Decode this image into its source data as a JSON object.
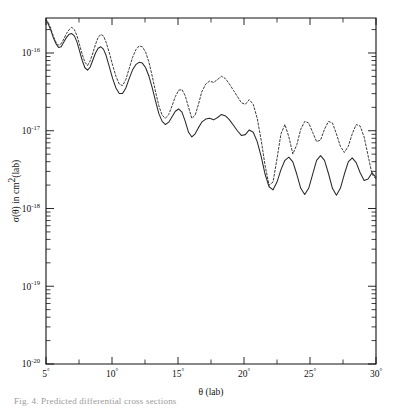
{
  "figure": {
    "name": "differential-cross-section-plot",
    "type": "line-plot",
    "caption_fragment": "Fig. 4. Predicted differential cross sections"
  },
  "axes": {
    "x": {
      "title": "θ (lab)",
      "min": 5,
      "max": 30,
      "unit": "degrees",
      "major_ticks": [
        5,
        10,
        15,
        20,
        25,
        30
      ],
      "major_tick_labels": [
        "5°",
        "10°",
        "15°",
        "20°",
        "25°",
        "30°"
      ],
      "minor_tick_step": 2.5,
      "scale": "linear"
    },
    "y": {
      "title": "σ(θ) in cm²(lab)",
      "title_base": "σ(θ) in cm",
      "title_sup": "2",
      "title_tail": "(lab)",
      "scale": "log",
      "min_exp": -20,
      "max_exp": -15.55,
      "decade_labels": [
        {
          "mantissa": "10",
          "exponent": "-16",
          "value_exp": -16
        },
        {
          "mantissa": "10",
          "exponent": "-17",
          "value_exp": -17
        },
        {
          "mantissa": "10",
          "exponent": "-18",
          "value_exp": -18
        },
        {
          "mantissa": "10",
          "exponent": "-19",
          "value_exp": -19
        },
        {
          "mantissa": "10",
          "exponent": "-20",
          "value_exp": -20
        }
      ]
    }
  },
  "colors": {
    "ink": "#1a1a1a",
    "axis": "#111111",
    "solid_curve": "#2a2a2a",
    "dashed_curve": "#3a3a3a",
    "background": "#ffffff"
  },
  "chart_data": {
    "type": "line",
    "title": "",
    "xlabel": "θ (lab)",
    "ylabel": "σ(θ) in cm²(lab)",
    "xlim": [
      5,
      30
    ],
    "ylim_exp": [
      -20,
      -15.55
    ],
    "yscale": "log",
    "grid": false,
    "legend": "none",
    "series": [
      {
        "name": "solid-curve",
        "style": "solid",
        "x": [
          5.0,
          5.15,
          5.35,
          5.55,
          5.75,
          5.95,
          6.15,
          6.35,
          6.55,
          6.75,
          6.95,
          7.15,
          7.35,
          7.55,
          7.75,
          7.95,
          8.15,
          8.35,
          8.55,
          8.75,
          8.95,
          9.15,
          9.35,
          9.55,
          9.8,
          10.05,
          10.3,
          10.55,
          10.8,
          11.05,
          11.3,
          11.55,
          11.8,
          12.05,
          12.3,
          12.55,
          12.8,
          13.05,
          13.3,
          13.55,
          13.8,
          14.05,
          14.3,
          14.55,
          14.8,
          15.05,
          15.3,
          15.55,
          15.8,
          16.05,
          16.3,
          16.55,
          16.8,
          17.1,
          17.4,
          17.7,
          18.0,
          18.3,
          18.6,
          18.9,
          19.2,
          19.5,
          19.8,
          20.1,
          20.4,
          20.7,
          21.0,
          21.3,
          21.6,
          21.9,
          22.2,
          22.5,
          22.8,
          23.1,
          23.4,
          23.7,
          24.0,
          24.3,
          24.6,
          24.9,
          25.2,
          25.5,
          25.8,
          26.1,
          26.4,
          26.7,
          27.0,
          27.3,
          27.6,
          27.9,
          28.2,
          28.5,
          28.8,
          29.1,
          29.4,
          29.7,
          30.0
        ],
        "y_exp": [
          -15.58,
          -15.62,
          -15.7,
          -15.8,
          -15.88,
          -15.93,
          -15.92,
          -15.86,
          -15.8,
          -15.76,
          -15.75,
          -15.78,
          -15.86,
          -15.98,
          -16.1,
          -16.19,
          -16.22,
          -16.18,
          -16.09,
          -16.0,
          -15.94,
          -15.92,
          -15.95,
          -16.03,
          -16.18,
          -16.33,
          -16.45,
          -16.52,
          -16.52,
          -16.45,
          -16.33,
          -16.22,
          -16.15,
          -16.12,
          -16.13,
          -16.19,
          -16.3,
          -16.45,
          -16.62,
          -16.78,
          -16.88,
          -16.92,
          -16.89,
          -16.82,
          -16.75,
          -16.72,
          -16.76,
          -16.88,
          -17.02,
          -17.08,
          -17.04,
          -16.96,
          -16.89,
          -16.85,
          -16.84,
          -16.86,
          -16.83,
          -16.79,
          -16.81,
          -16.86,
          -16.93,
          -17.0,
          -17.06,
          -17.05,
          -16.99,
          -17.02,
          -17.14,
          -17.33,
          -17.56,
          -17.72,
          -17.76,
          -17.66,
          -17.5,
          -17.38,
          -17.34,
          -17.4,
          -17.56,
          -17.74,
          -17.82,
          -17.74,
          -17.56,
          -17.38,
          -17.32,
          -17.38,
          -17.55,
          -17.74,
          -17.83,
          -17.74,
          -17.56,
          -17.4,
          -17.35,
          -17.41,
          -17.54,
          -17.64,
          -17.62,
          -17.54,
          -17.6
        ]
      },
      {
        "name": "dashed-curve",
        "style": "dashed",
        "x": [
          5.0,
          5.15,
          5.35,
          5.55,
          5.75,
          5.95,
          6.15,
          6.35,
          6.55,
          6.75,
          6.95,
          7.15,
          7.35,
          7.55,
          7.75,
          7.95,
          8.15,
          8.35,
          8.55,
          8.75,
          8.95,
          9.15,
          9.35,
          9.55,
          9.8,
          10.05,
          10.3,
          10.55,
          10.8,
          11.05,
          11.3,
          11.55,
          11.8,
          12.05,
          12.3,
          12.55,
          12.8,
          13.05,
          13.3,
          13.55,
          13.8,
          14.05,
          14.3,
          14.55,
          14.8,
          15.05,
          15.3,
          15.55,
          15.8,
          16.05,
          16.3,
          16.55,
          16.8,
          17.1,
          17.4,
          17.7,
          18.0,
          18.3,
          18.6,
          18.9,
          19.2,
          19.5,
          19.8,
          20.1,
          20.4,
          20.7,
          21.0,
          21.3,
          21.6,
          21.9,
          22.2,
          22.5,
          22.8,
          23.1,
          23.4,
          23.7,
          24.0,
          24.3,
          24.6,
          24.9,
          25.2,
          25.5,
          25.8,
          26.1,
          26.4,
          26.7,
          27.0,
          27.3,
          27.6,
          27.9,
          28.2,
          28.5,
          28.8,
          29.1,
          29.4,
          29.7,
          30.0
        ],
        "y_exp": [
          -15.57,
          -15.6,
          -15.68,
          -15.78,
          -15.86,
          -15.9,
          -15.88,
          -15.82,
          -15.75,
          -15.7,
          -15.67,
          -15.7,
          -15.78,
          -15.9,
          -16.02,
          -16.12,
          -16.16,
          -16.1,
          -16.0,
          -15.89,
          -15.8,
          -15.76,
          -15.78,
          -15.86,
          -16.0,
          -16.16,
          -16.3,
          -16.4,
          -16.42,
          -16.34,
          -16.2,
          -16.06,
          -15.96,
          -15.91,
          -15.92,
          -15.99,
          -16.12,
          -16.3,
          -16.5,
          -16.68,
          -16.8,
          -16.84,
          -16.79,
          -16.68,
          -16.56,
          -16.48,
          -16.47,
          -16.55,
          -16.7,
          -16.84,
          -16.8,
          -16.66,
          -16.5,
          -16.4,
          -16.36,
          -16.38,
          -16.34,
          -16.3,
          -16.33,
          -16.4,
          -16.48,
          -16.56,
          -16.64,
          -16.66,
          -16.6,
          -16.66,
          -16.84,
          -17.12,
          -17.45,
          -17.7,
          -17.66,
          -17.36,
          -17.04,
          -16.92,
          -17.08,
          -17.3,
          -17.18,
          -16.98,
          -16.88,
          -16.9,
          -17.02,
          -17.14,
          -17.12,
          -16.98,
          -16.88,
          -16.9,
          -17.04,
          -17.2,
          -17.28,
          -17.2,
          -17.04,
          -16.92,
          -16.94,
          -17.08,
          -17.32,
          -17.56,
          -17.62
        ]
      }
    ]
  }
}
